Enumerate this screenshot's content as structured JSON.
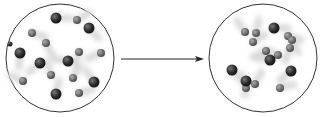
{
  "diagram": {
    "type": "particle-reaction",
    "colors": {
      "container_stroke": "#333333",
      "large_particle": "#2b2b2b",
      "small_particle": "#6e6e6e",
      "motion_trail": "#d9d9d9",
      "arrow": "#222222"
    },
    "before": {
      "label": "",
      "center": [
        60,
        58
      ],
      "radius": 54,
      "large_particles": [
        [
          56,
          18
        ],
        [
          89,
          28
        ],
        [
          20,
          53
        ],
        [
          40,
          63
        ],
        [
          68,
          61
        ],
        [
          94,
          82
        ],
        [
          56,
          94
        ]
      ],
      "small_particles": [
        [
          77,
          20
        ],
        [
          32,
          33
        ],
        [
          46,
          43
        ],
        [
          79,
          52
        ],
        [
          101,
          53
        ],
        [
          23,
          81
        ],
        [
          51,
          75
        ],
        [
          73,
          78
        ],
        [
          79,
          93
        ]
      ],
      "tiny_particles": [
        [
          10,
          44
        ]
      ]
    },
    "after": {
      "label": "",
      "center": [
        263,
        58
      ],
      "radius": 54,
      "large_particles": [
        [
          274,
          28
        ],
        [
          232,
          70
        ],
        [
          246,
          81
        ],
        [
          291,
          71
        ],
        [
          270,
          60
        ]
      ],
      "small_particles": [
        [
          245,
          32
        ],
        [
          256,
          33
        ],
        [
          253,
          42
        ],
        [
          288,
          36
        ],
        [
          292,
          40
        ],
        [
          290,
          48
        ],
        [
          266,
          51
        ],
        [
          278,
          55
        ],
        [
          246,
          88
        ],
        [
          255,
          84
        ],
        [
          280,
          88
        ]
      ]
    },
    "arrow": {
      "from": [
        121,
        59
      ],
      "to": [
        204,
        59
      ]
    }
  }
}
